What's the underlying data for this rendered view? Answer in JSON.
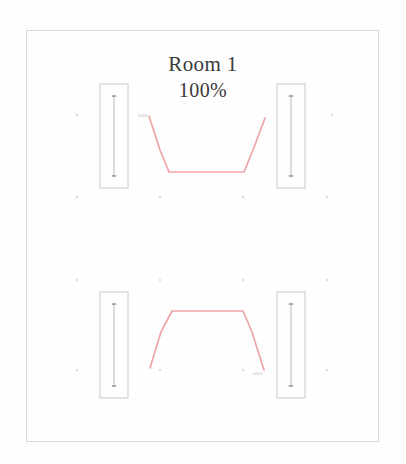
{
  "drawing": {
    "title": "Room 1",
    "scale_label": "100%",
    "frame": {
      "x": 26,
      "y": 30,
      "width": 353,
      "height": 412,
      "stroke": "#d8d8d8"
    },
    "background_color": "#ffffff",
    "line_color": "#c9c9c9",
    "duct_color": "#f0a5a5"
  },
  "wall_panels": [
    {
      "name": "upper-left",
      "x": 100,
      "y": 84,
      "width": 28,
      "height": 104
    },
    {
      "name": "upper-right",
      "x": 277,
      "y": 84,
      "width": 28,
      "height": 104
    },
    {
      "name": "lower-left",
      "x": 100,
      "y": 292,
      "width": 28,
      "height": 106
    },
    {
      "name": "lower-right",
      "x": 277,
      "y": 292,
      "width": 28,
      "height": 106
    }
  ],
  "ducts": [
    {
      "name": "upper-duct",
      "orientation": "opening-up",
      "points": "149,116 160,150 169,172 244,172 253,150 265,118"
    },
    {
      "name": "lower-duct",
      "orientation": "opening-down",
      "points": "150,368 161,332 172,311 243,311 252,332 264,370"
    }
  ],
  "grid_dots": [
    {
      "x": 77,
      "y": 115
    },
    {
      "x": 332,
      "y": 115
    },
    {
      "x": 77,
      "y": 197
    },
    {
      "x": 160,
      "y": 197
    },
    {
      "x": 243,
      "y": 197
    },
    {
      "x": 327,
      "y": 197
    },
    {
      "x": 77,
      "y": 280
    },
    {
      "x": 160,
      "y": 280
    },
    {
      "x": 243,
      "y": 280
    },
    {
      "x": 327,
      "y": 280
    },
    {
      "x": 77,
      "y": 370
    },
    {
      "x": 160,
      "y": 370
    },
    {
      "x": 243,
      "y": 370
    },
    {
      "x": 327,
      "y": 370
    }
  ],
  "micro_labels": [
    {
      "name": "upper-duct-tag",
      "text": "4000",
      "x": 138,
      "y": 117
    },
    {
      "name": "lower-duct-tag",
      "text": "4000",
      "x": 253,
      "y": 375
    }
  ]
}
